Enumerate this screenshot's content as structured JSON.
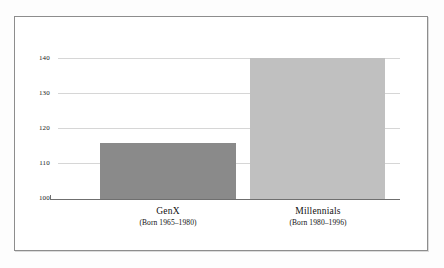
{
  "chart_data": {
    "type": "bar",
    "title": "",
    "subtitle": "",
    "xlabel": "",
    "ylabel": "Overall Customer Expectations",
    "categories": [
      "GenX",
      "Millennials"
    ],
    "category_sublabels": [
      "(Born 1965–1980)",
      "(Born 1980–1996)"
    ],
    "values": [
      116,
      140
    ],
    "ylim": [
      100,
      140
    ],
    "yticks": [
      100,
      110,
      120,
      130,
      140
    ],
    "ytick_labels": [
      "100",
      "110",
      "120",
      "130",
      "140"
    ],
    "grid": true,
    "legend": "none",
    "bar_colors": [
      "#8a8a8a",
      "#c0c0c0"
    ],
    "background_color": "#ffffff",
    "frame_color": "#8d8d8d",
    "gridline_color": "#d6d6d6",
    "axis_color": "#6f6f6f"
  }
}
